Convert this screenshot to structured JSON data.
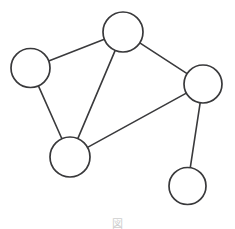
{
  "figure": {
    "caption_text": "図",
    "background_color": "#ffffff",
    "width": 235,
    "height": 229
  },
  "style": {
    "node_fill": "#ffffff",
    "node_stroke": "#39393b",
    "node_stroke_width": 1.7,
    "edge_stroke": "#3a3a3c",
    "edge_stroke_width": 1.6
  },
  "graph": {
    "node_count": 5,
    "edge_count": 6,
    "directed": false,
    "nodes": [
      {
        "id": "top",
        "label": "",
        "cx": 123,
        "cy": 32,
        "r": 20.0
      },
      {
        "id": "left",
        "label": "",
        "cx": 30.5,
        "cy": 68,
        "r": 19.5
      },
      {
        "id": "right",
        "label": "",
        "cx": 203,
        "cy": 84,
        "r": 19.0
      },
      {
        "id": "bottom-left",
        "label": "",
        "cx": 70,
        "cy": 157,
        "r": 20.0
      },
      {
        "id": "bottom-right",
        "label": "",
        "cx": 187.5,
        "cy": 186,
        "r": 18.5
      }
    ],
    "edges": [
      {
        "id": "edge-left-top",
        "source": "left",
        "target": "top"
      },
      {
        "id": "edge-top-right",
        "source": "top",
        "target": "right"
      },
      {
        "id": "edge-top-bottom-left",
        "source": "top",
        "target": "bottom-left"
      },
      {
        "id": "edge-left-bottom-left",
        "source": "left",
        "target": "bottom-left"
      },
      {
        "id": "edge-bottom-left-right",
        "source": "bottom-left",
        "target": "right"
      },
      {
        "id": "edge-right-bottom-right",
        "source": "right",
        "target": "bottom-right"
      }
    ]
  }
}
